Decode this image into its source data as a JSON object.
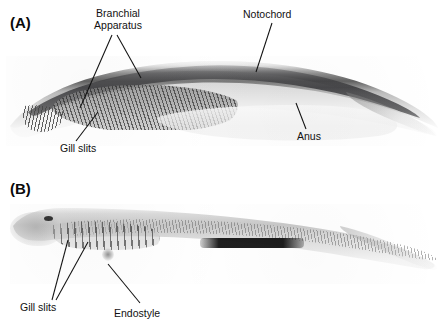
{
  "figure": {
    "background_color": "#ffffff",
    "label_color": "#111111",
    "panel_count": 2
  },
  "panels": [
    {
      "id": "A",
      "label": "(A)",
      "specimen_description": "Arched amphioxus larva, lateral view, grayscale photomicrograph",
      "annotations": [
        {
          "name": "branchial-apparatus",
          "text_lines": [
            "Branchial",
            "Apparatus"
          ],
          "text": "Branchial Apparatus",
          "leader_count": 2
        },
        {
          "name": "gill-slits",
          "text_lines": [
            "Gill slits"
          ],
          "text": "Gill slits",
          "leader_count": 1
        },
        {
          "name": "notochord",
          "text_lines": [
            "Notochord"
          ],
          "text": "Notochord",
          "leader_count": 1
        },
        {
          "name": "anus",
          "text_lines": [
            "Anus"
          ],
          "text": "Anus",
          "leader_count": 1
        }
      ]
    },
    {
      "id": "B",
      "label": "(B)",
      "specimen_description": "Elongate amphioxus larva with segmented myotomes, lateral view, grayscale photomicrograph",
      "annotations": [
        {
          "name": "gill-slits",
          "text_lines": [
            "Gill slits"
          ],
          "text": "Gill slits",
          "leader_count": 2
        },
        {
          "name": "endostyle",
          "text_lines": [
            "Endostyle"
          ],
          "text": "Endostyle",
          "leader_count": 1
        }
      ]
    }
  ],
  "labels": {
    "panel_a": "(A)",
    "panel_b": "(B)",
    "branchial_line1": "Branchial",
    "branchial_line2": "Apparatus",
    "gill_slits_a": "Gill slits",
    "notochord": "Notochord",
    "anus": "Anus",
    "gill_slits_b": "Gill slits",
    "endostyle": "Endostyle"
  }
}
